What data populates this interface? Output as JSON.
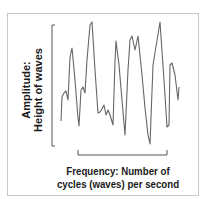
{
  "diagram": {
    "title": "",
    "y_axis_label_line1": "Amplitude:",
    "y_axis_label_line2": "Height of waves",
    "x_axis_label_line1": "Frequency: Number of",
    "x_axis_label_line2": "cycles (waves) per second",
    "line_color": "#666666",
    "bracket_color": "#555555",
    "text_color": "#1a1a1a"
  },
  "chart_data": {
    "type": "line",
    "title": "",
    "xlabel": "Frequency: Number of cycles (waves) per second",
    "ylabel": "Amplitude: Height of waves",
    "grid": false,
    "legend": null,
    "series": [
      {
        "name": "wave",
        "points_px": [
          [
            61,
            121
          ],
          [
            62,
            97
          ],
          [
            64,
            93
          ],
          [
            66,
            91
          ],
          [
            68,
            100
          ],
          [
            70,
            57
          ],
          [
            72,
            48
          ],
          [
            75,
            80
          ],
          [
            78,
            118
          ],
          [
            79,
            126
          ],
          [
            81,
            90
          ],
          [
            83,
            87
          ],
          [
            85,
            93
          ],
          [
            87,
            60
          ],
          [
            90,
            25
          ],
          [
            92,
            22
          ],
          [
            95,
            70
          ],
          [
            98,
            113
          ],
          [
            100,
            112
          ],
          [
            102,
            109
          ],
          [
            104,
            105
          ],
          [
            106,
            115
          ],
          [
            108,
            110
          ],
          [
            110,
            115
          ],
          [
            113,
            125
          ],
          [
            115,
            62
          ],
          [
            116,
            41
          ],
          [
            119,
            65
          ],
          [
            125,
            135
          ],
          [
            128,
            70
          ],
          [
            130,
            40
          ],
          [
            132,
            36
          ],
          [
            135,
            50
          ],
          [
            138,
            36
          ],
          [
            142,
            75
          ],
          [
            145,
            108
          ],
          [
            148,
            135
          ],
          [
            150,
            144
          ],
          [
            153,
            65
          ],
          [
            160,
            22
          ],
          [
            165,
            95
          ],
          [
            167,
            127
          ],
          [
            169,
            125
          ],
          [
            170,
            65
          ],
          [
            172,
            63
          ],
          [
            175,
            75
          ],
          [
            178,
            100
          ],
          [
            179,
            87
          ]
        ]
      }
    ]
  }
}
